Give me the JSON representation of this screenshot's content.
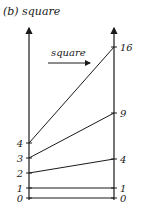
{
  "title": "(b) square",
  "function_label": "square",
  "diagram": {
    "type": "mapping",
    "function": "square",
    "domain_values": [
      0,
      1,
      2,
      3,
      4
    ],
    "codomain_values": [
      0,
      1,
      4,
      9,
      16
    ],
    "mappings": [
      {
        "from": 0,
        "to": 0
      },
      {
        "from": 1,
        "to": 1
      },
      {
        "from": 2,
        "to": 4
      },
      {
        "from": 3,
        "to": 9
      },
      {
        "from": 4,
        "to": 16
      }
    ],
    "left_labels": [
      "0",
      "1",
      "2",
      "3",
      "4"
    ],
    "right_labels": [
      "0",
      "1",
      "4",
      "9",
      "16"
    ],
    "line_color": "#1a1a1a"
  }
}
